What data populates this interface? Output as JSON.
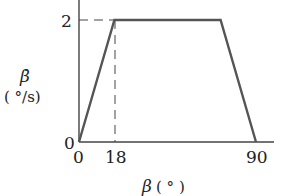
{
  "chart_data": {
    "type": "line",
    "title": "",
    "xlabel": "β (°)",
    "ylabel": "β̇ (°/s)",
    "ylabel_symbol": "β̇",
    "ylabel_unit": "( °/s)",
    "xlabel_symbol": "β",
    "xlabel_unit": "( ° )",
    "x": [
      0,
      18,
      72,
      90
    ],
    "series": [
      {
        "name": "β̇ profile",
        "values": [
          0,
          2,
          2,
          0
        ]
      }
    ],
    "xticks": [
      "0",
      "18",
      "90"
    ],
    "yticks": [
      "0",
      "2"
    ],
    "xlim": [
      0,
      98
    ],
    "ylim": [
      0,
      2.2
    ],
    "grid": false,
    "legend": "none",
    "annotations": [
      {
        "type": "dashed-guide",
        "description": "vertical dashed line at β = 18 up to β̇ = 2"
      },
      {
        "type": "dashed-guide",
        "description": "horizontal dashed line at β̇ = 2 from the y-axis to β = 18"
      }
    ]
  },
  "colors": {
    "line": "#555555",
    "axis": "#444444",
    "text": "#222222"
  }
}
